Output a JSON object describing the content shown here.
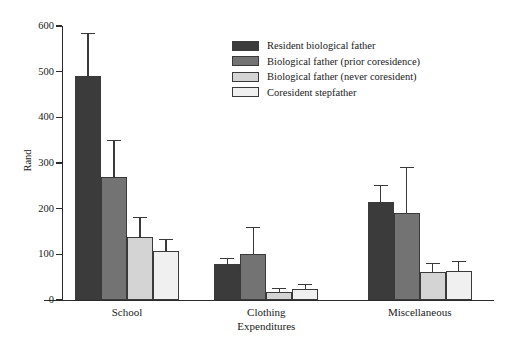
{
  "chart_data": {
    "type": "bar",
    "title": "",
    "xlabel": "Expenditures",
    "ylabel": "Rand",
    "categories": [
      "School",
      "Clothing",
      "Miscellaneous"
    ],
    "ylim": [
      0,
      600
    ],
    "yticks": [
      0,
      100,
      200,
      300,
      400,
      500,
      600
    ],
    "grid": false,
    "legend_position": "top-center",
    "series": [
      {
        "name": "Resident biological father",
        "color": "#3b3b3b",
        "values": [
          490,
          78,
          215
        ],
        "error_upper": [
          583,
          90,
          250
        ]
      },
      {
        "name": "Biological father (prior coresidence)",
        "color": "#737373",
        "values": [
          270,
          100,
          190
        ],
        "error_upper": [
          348,
          158,
          288
        ]
      },
      {
        "name": "Biological father (never coresident)",
        "color": "#d4d4d4",
        "values": [
          139,
          18,
          61
        ],
        "error_upper": [
          180,
          24,
          78
        ]
      },
      {
        "name": "Coresident stepfather",
        "color": "#f0f0f0",
        "values": [
          108,
          25,
          64
        ],
        "error_upper": [
          131,
          33,
          83
        ]
      }
    ]
  },
  "axis": {
    "y_title": "Rand",
    "x_title": "Expenditures",
    "tick_labels": [
      "600",
      "500",
      "400",
      "300",
      "200",
      "100",
      "0"
    ]
  },
  "legend": {
    "items": [
      {
        "label": "Resident biological father"
      },
      {
        "label": "Biological father (prior coresidence)"
      },
      {
        "label": "Biological father (never coresident)"
      },
      {
        "label": "Coresident stepfather"
      }
    ]
  }
}
